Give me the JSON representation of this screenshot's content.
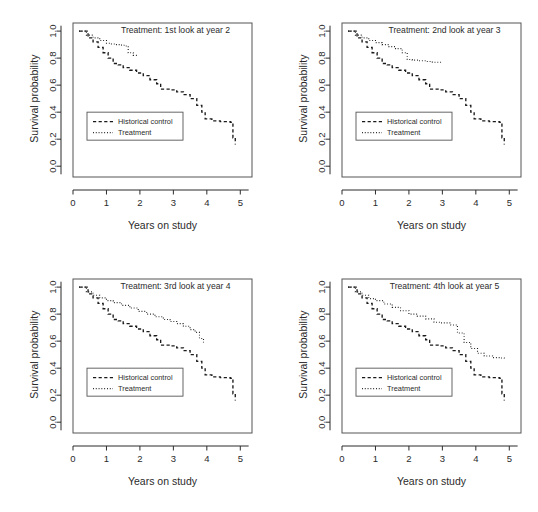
{
  "figure": {
    "layout": "2x2 grid of Kaplan-Meier survival plots",
    "background": "#ffffff",
    "ink_color": "#1a1a1a"
  },
  "axes": {
    "xlabel": "Years on study",
    "ylabel": "Survival probability",
    "xticks": [
      "0",
      "1",
      "2",
      "3",
      "4",
      "5"
    ],
    "yticks": [
      "0.0",
      "0.2",
      "0.4",
      "0.6",
      "0.8",
      "1.0"
    ],
    "xlim": [
      0,
      5.35
    ],
    "ylim": [
      -0.08,
      1.06
    ]
  },
  "legend": {
    "control_label": "Historical control",
    "treatment_label": "Treatment"
  },
  "chart_data": [
    {
      "type": "line",
      "title": "Treatment: 1st look at year 2",
      "xlabel": "Years on study",
      "ylabel": "Survival probability",
      "xlim": [
        0,
        5.35
      ],
      "ylim": [
        -0.08,
        1.06
      ],
      "grid": false,
      "legend_position": "center-left",
      "series": [
        {
          "name": "Historical control",
          "style": "dashed",
          "x": [
            0.18,
            0.45,
            0.6,
            0.75,
            0.9,
            1.05,
            1.2,
            1.35,
            1.5,
            1.7,
            1.9,
            2.1,
            2.3,
            2.5,
            2.62,
            2.9,
            3.1,
            3.3,
            3.5,
            3.7,
            3.85,
            3.95,
            4.15,
            4.4,
            4.7,
            4.78,
            4.85
          ],
          "y": [
            1.0,
            0.95,
            0.92,
            0.88,
            0.84,
            0.8,
            0.76,
            0.75,
            0.73,
            0.71,
            0.69,
            0.67,
            0.64,
            0.61,
            0.57,
            0.565,
            0.55,
            0.53,
            0.5,
            0.45,
            0.4,
            0.35,
            0.335,
            0.33,
            0.325,
            0.21,
            0.16
          ]
        },
        {
          "name": "Treatment",
          "style": "dotted",
          "x": [
            0.18,
            0.4,
            0.6,
            0.8,
            1.0,
            1.15,
            1.3,
            1.45,
            1.55,
            1.65,
            1.8,
            1.92
          ],
          "y": [
            1.0,
            0.97,
            0.95,
            0.93,
            0.91,
            0.905,
            0.9,
            0.895,
            0.89,
            0.84,
            0.82,
            0.81
          ]
        }
      ]
    },
    {
      "type": "line",
      "title": "Treatment: 2nd look at year 3",
      "xlabel": "Years on study",
      "ylabel": "Survival probability",
      "xlim": [
        0,
        5.35
      ],
      "ylim": [
        -0.08,
        1.06
      ],
      "grid": false,
      "legend_position": "center-left",
      "series": [
        {
          "name": "Historical control",
          "style": "dashed",
          "x": [
            0.18,
            0.45,
            0.6,
            0.75,
            0.9,
            1.05,
            1.2,
            1.35,
            1.5,
            1.7,
            1.9,
            2.1,
            2.3,
            2.5,
            2.62,
            2.9,
            3.1,
            3.3,
            3.5,
            3.7,
            3.85,
            3.95,
            4.15,
            4.4,
            4.7,
            4.78,
            4.85
          ],
          "y": [
            1.0,
            0.95,
            0.92,
            0.88,
            0.84,
            0.8,
            0.76,
            0.75,
            0.73,
            0.71,
            0.69,
            0.67,
            0.64,
            0.61,
            0.57,
            0.565,
            0.55,
            0.53,
            0.5,
            0.45,
            0.4,
            0.35,
            0.335,
            0.33,
            0.325,
            0.21,
            0.16
          ]
        },
        {
          "name": "Treatment",
          "style": "dotted",
          "x": [
            0.18,
            0.4,
            0.6,
            0.8,
            1.0,
            1.2,
            1.4,
            1.6,
            1.8,
            1.95,
            2.1,
            2.3,
            2.5,
            2.7,
            2.9,
            3.0
          ],
          "y": [
            1.0,
            0.97,
            0.95,
            0.93,
            0.915,
            0.9,
            0.885,
            0.87,
            0.84,
            0.79,
            0.785,
            0.78,
            0.775,
            0.77,
            0.77,
            0.77
          ]
        }
      ]
    },
    {
      "type": "line",
      "title": "Treatment: 3rd look at year 4",
      "xlabel": "Years on study",
      "ylabel": "Survival probability",
      "xlim": [
        0,
        5.35
      ],
      "ylim": [
        -0.08,
        1.06
      ],
      "grid": false,
      "legend_position": "center-left",
      "series": [
        {
          "name": "Historical control",
          "style": "dashed",
          "x": [
            0.18,
            0.45,
            0.6,
            0.75,
            0.9,
            1.05,
            1.2,
            1.35,
            1.5,
            1.7,
            1.9,
            2.1,
            2.3,
            2.5,
            2.62,
            2.9,
            3.1,
            3.3,
            3.5,
            3.7,
            3.85,
            3.95,
            4.15,
            4.4,
            4.7,
            4.78,
            4.85
          ],
          "y": [
            1.0,
            0.95,
            0.92,
            0.88,
            0.84,
            0.8,
            0.76,
            0.75,
            0.73,
            0.71,
            0.69,
            0.67,
            0.64,
            0.61,
            0.57,
            0.565,
            0.55,
            0.53,
            0.5,
            0.45,
            0.4,
            0.35,
            0.335,
            0.33,
            0.325,
            0.21,
            0.16
          ]
        },
        {
          "name": "Treatment",
          "style": "dotted",
          "x": [
            0.18,
            0.4,
            0.6,
            0.8,
            1.0,
            1.2,
            1.45,
            1.7,
            1.95,
            2.2,
            2.45,
            2.7,
            2.9,
            3.1,
            3.3,
            3.5,
            3.65,
            3.78,
            3.9
          ],
          "y": [
            1.0,
            0.965,
            0.94,
            0.92,
            0.9,
            0.885,
            0.865,
            0.845,
            0.82,
            0.8,
            0.78,
            0.76,
            0.745,
            0.73,
            0.71,
            0.685,
            0.665,
            0.62,
            0.59
          ]
        }
      ]
    },
    {
      "type": "line",
      "title": "Treatment: 4th look at year 5",
      "xlabel": "Years on study",
      "ylabel": "Survival probability",
      "xlim": [
        0,
        5.35
      ],
      "ylim": [
        -0.08,
        1.06
      ],
      "grid": false,
      "legend_position": "center-left",
      "series": [
        {
          "name": "Historical control",
          "style": "dashed",
          "x": [
            0.18,
            0.45,
            0.6,
            0.75,
            0.9,
            1.05,
            1.2,
            1.35,
            1.5,
            1.7,
            1.9,
            2.1,
            2.3,
            2.5,
            2.62,
            2.9,
            3.1,
            3.3,
            3.5,
            3.7,
            3.85,
            3.95,
            4.15,
            4.4,
            4.7,
            4.78,
            4.85
          ],
          "y": [
            1.0,
            0.95,
            0.92,
            0.88,
            0.84,
            0.8,
            0.76,
            0.75,
            0.73,
            0.71,
            0.69,
            0.67,
            0.64,
            0.61,
            0.57,
            0.565,
            0.55,
            0.53,
            0.5,
            0.45,
            0.4,
            0.35,
            0.335,
            0.33,
            0.325,
            0.21,
            0.16
          ]
        },
        {
          "name": "Treatment",
          "style": "dotted",
          "x": [
            0.18,
            0.4,
            0.6,
            0.8,
            1.0,
            1.25,
            1.5,
            1.75,
            2.0,
            2.25,
            2.5,
            2.75,
            2.95,
            3.1,
            3.25,
            3.45,
            3.65,
            3.85,
            4.05,
            4.25,
            4.5,
            4.75,
            4.85
          ],
          "y": [
            1.0,
            0.965,
            0.94,
            0.915,
            0.9,
            0.875,
            0.85,
            0.825,
            0.8,
            0.785,
            0.765,
            0.74,
            0.735,
            0.735,
            0.72,
            0.66,
            0.59,
            0.545,
            0.51,
            0.49,
            0.478,
            0.475,
            0.47
          ]
        }
      ]
    }
  ]
}
